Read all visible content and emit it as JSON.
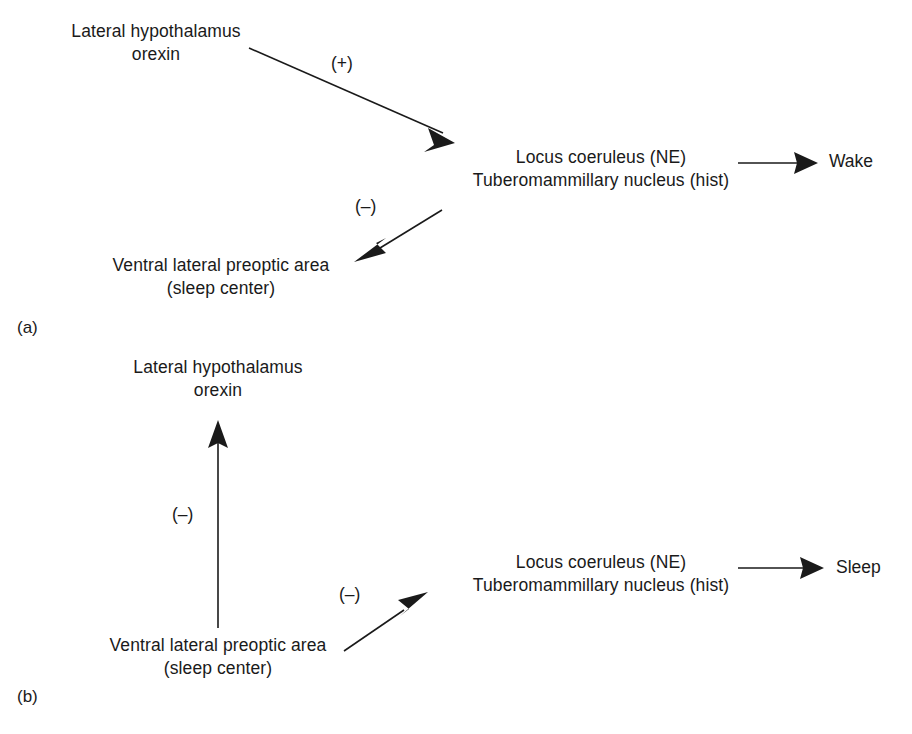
{
  "figure": {
    "background_color": "#ffffff",
    "ink_color": "#1a1a1a",
    "panels": [
      {
        "id": "a",
        "label": "(a)",
        "nodes": {
          "lateral_hypothalamus": {
            "line1": "Lateral hypothalamus",
            "line2": "orexin"
          },
          "locus_coeruleus": {
            "line1": "Locus coeruleus (NE)",
            "line2": "Tuberomammillary nucleus (hist)"
          },
          "vlpo": {
            "line1": "Ventral lateral preoptic area",
            "line2": "(sleep center)"
          }
        },
        "outcome": "Wake",
        "edges": [
          {
            "from": "lateral_hypothalamus",
            "to": "locus_coeruleus",
            "sign": "(+)"
          },
          {
            "from": "locus_coeruleus",
            "to": "vlpo",
            "sign": "(–)"
          },
          {
            "from": "locus_coeruleus",
            "to": "outcome",
            "sign": ""
          }
        ]
      },
      {
        "id": "b",
        "label": "(b)",
        "nodes": {
          "lateral_hypothalamus": {
            "line1": "Lateral hypothalamus",
            "line2": "orexin"
          },
          "locus_coeruleus": {
            "line1": "Locus coeruleus (NE)",
            "line2": "Tuberomammillary nucleus (hist)"
          },
          "vlpo": {
            "line1": "Ventral lateral preoptic area",
            "line2": "(sleep center)"
          }
        },
        "outcome": "Sleep",
        "edges": [
          {
            "from": "vlpo",
            "to": "lateral_hypothalamus",
            "sign": "(–)"
          },
          {
            "from": "vlpo",
            "to": "locus_coeruleus",
            "sign": "(–)"
          },
          {
            "from": "locus_coeruleus",
            "to": "outcome",
            "sign": ""
          }
        ]
      }
    ]
  }
}
